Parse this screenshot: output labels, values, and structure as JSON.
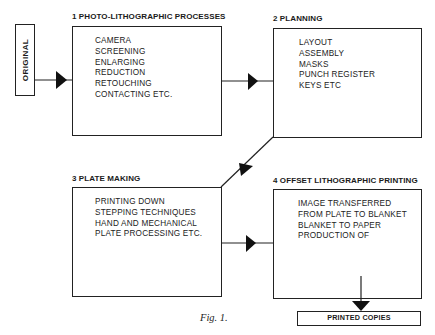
{
  "diagram": {
    "source_label": "ORIGINAL",
    "stages": [
      {
        "number": "1",
        "title": "1  PHOTO-LITHOGRAPHIC PROCESSES",
        "items": [
          "CAMERA",
          "SCREENING",
          "ENLARGING",
          "REDUCTION",
          "RETOUCHING",
          "CONTACTING ETC."
        ]
      },
      {
        "number": "2",
        "title": "2  PLANNING",
        "items": [
          "LAYOUT",
          "ASSEMBLY",
          "MASKS",
          "PUNCH REGISTER",
          "KEYS ETC"
        ]
      },
      {
        "number": "3",
        "title": "3  PLATE MAKING",
        "items": [
          "PRINTING DOWN",
          "STEPPING TECHNIQUES",
          "HAND AND MECHANICAL",
          "PLATE PROCESSING ETC."
        ]
      },
      {
        "number": "4",
        "title": "4  OFFSET LITHOGRAPHIC PRINTING",
        "items": [
          "IMAGE TRANSFERRED",
          "FROM PLATE TO BLANKET",
          "BLANKET TO PAPER",
          "PRODUCTION OF"
        ]
      }
    ],
    "output_label": "PRINTED COPIES",
    "caption": "Fig. 1.",
    "flow": [
      {
        "from": "ORIGINAL",
        "to": "1"
      },
      {
        "from": "1",
        "to": "2"
      },
      {
        "from": "2",
        "to": "3"
      },
      {
        "from": "3",
        "to": "4"
      },
      {
        "from": "4",
        "to": "PRINTED COPIES"
      }
    ],
    "colors": {
      "ink": "#1a1a1a",
      "background": "#ffffff"
    }
  }
}
